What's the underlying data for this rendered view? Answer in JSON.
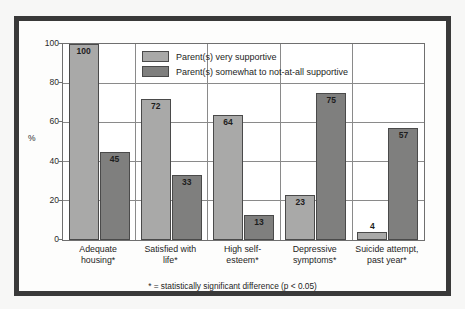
{
  "figure": {
    "y_axis_title": "%",
    "footnote": "* = statistically significant difference (p < 0.05)",
    "legend": [
      {
        "label": "Parent(s) very supportive",
        "swatch": "light-gray-swatch",
        "color": "#a9a9a8"
      },
      {
        "label": "Parent(s) somewhat to not-at-all supportive",
        "swatch": "dark-gray-swatch",
        "color": "#7f7f7e"
      }
    ],
    "y_ticks": [
      "0",
      "20",
      "40",
      "60",
      "80",
      "100"
    ],
    "frame_color": "#393939"
  },
  "chart_data": {
    "type": "bar",
    "title": "",
    "xlabel": "",
    "ylabel": "%",
    "ylim": [
      0,
      100
    ],
    "yticks": [
      0,
      20,
      40,
      60,
      80,
      100
    ],
    "grid": true,
    "legend_position": "top-center-inside",
    "categories": [
      "Adequate housing*",
      "Satisfied with life*",
      "High self-esteem*",
      "Depressive symptoms*",
      "Suicide attempt, past year*"
    ],
    "category_lines": [
      [
        "Adequate",
        "housing*"
      ],
      [
        "Satisfied with",
        "life*"
      ],
      [
        "High self-",
        "esteem*"
      ],
      [
        "Depressive",
        "symptoms*"
      ],
      [
        "Suicide attempt,",
        "past year*"
      ]
    ],
    "series": [
      {
        "name": "Parent(s) very supportive",
        "color": "#a9a9a8",
        "values": [
          100,
          72,
          64,
          23,
          4
        ]
      },
      {
        "name": "Parent(s) somewhat to not-at-all supportive",
        "color": "#7f7f7e",
        "values": [
          45,
          33,
          13,
          75,
          57
        ]
      }
    ],
    "annotations": [
      "* = statistically significant difference (p < 0.05)"
    ]
  }
}
